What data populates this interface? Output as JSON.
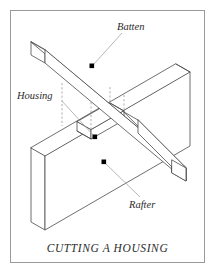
{
  "figure": {
    "caption": "CUTTING A HOUSING",
    "border_color": "#9a9a9a",
    "background_color": "#ffffff",
    "line_color": "#4a4a4a",
    "hidden_line_color": "#8d8d8d",
    "leader_color": "#8a8a8a",
    "dot_color": "#000000",
    "text_color": "#2b2b2b",
    "width": 217,
    "height": 275
  },
  "labels": [
    {
      "id": "batten",
      "text": "Batten",
      "x": 117,
      "y": 22,
      "callout_dot": {
        "x": 92,
        "y": 66
      },
      "leader_from": {
        "x": 123,
        "y": 33
      }
    },
    {
      "id": "housing",
      "text": "Housing",
      "x": 17,
      "y": 91,
      "callout_dot": {
        "x": 95,
        "y": 137
      },
      "leader_from": {
        "x": 62,
        "y": 101
      }
    },
    {
      "id": "rafter",
      "text": "Rafter",
      "x": 129,
      "y": 200,
      "callout_dot": {
        "x": 104,
        "y": 162
      },
      "leader_from": {
        "x": 139,
        "y": 198
      }
    }
  ],
  "parts": [
    {
      "id": "batten",
      "name": "Batten",
      "description": "Long rectangular timber beam running diagonally from upper-left down to the right, resting across the rafter"
    },
    {
      "id": "rafter",
      "name": "Rafter",
      "description": "Large flat board standing on edge, running horizontally below the batten"
    },
    {
      "id": "housing",
      "name": "Housing",
      "description": "Rectangular notch cut into the top edge of the rafter to receive the batten"
    }
  ],
  "hidden_lines": {
    "count": 3,
    "style": "dashed",
    "description": "Vertical dashed projection lines from the batten down into the housing notch"
  }
}
